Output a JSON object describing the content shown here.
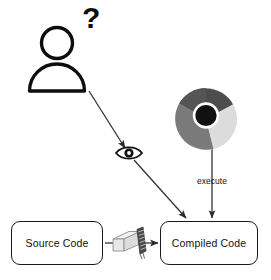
{
  "diagram": {
    "background_color": "#ffffff",
    "line_color": "#333333",
    "stroke_color": "#1a1a1a",
    "nodes": [
      {
        "id": "source_code",
        "label": "Source Code",
        "shape": "rounded-rectangle"
      },
      {
        "id": "compiled_code",
        "label": "Compiled Code",
        "shape": "rounded-rectangle"
      }
    ],
    "icons": [
      {
        "id": "person",
        "name": "person-icon",
        "description": "user silhouette with head and shoulders"
      },
      {
        "id": "question",
        "name": "question-mark",
        "label": "?"
      },
      {
        "id": "eye",
        "name": "eye-icon",
        "description": "eye observing"
      },
      {
        "id": "chrome",
        "name": "chrome-browser-icon",
        "description": "browser logo circle with center dot"
      },
      {
        "id": "compiler",
        "name": "compiler-icon",
        "description": "compiler machine grinding documents"
      }
    ],
    "edges": [
      {
        "id": "source_to_compiler",
        "label": "",
        "from": "source_code",
        "to": "compiler"
      },
      {
        "id": "compiler_to_compiled",
        "label": "",
        "from": "compiler",
        "to": "compiled_code"
      },
      {
        "id": "person_to_compiled",
        "label": "",
        "from": "person",
        "to": "compiled_code",
        "via": "eye"
      },
      {
        "id": "chrome_to_compiled",
        "label": "execute",
        "from": "chrome",
        "to": "compiled_code"
      }
    ],
    "labels": {
      "execute": "execute",
      "question": "?"
    },
    "colors": {
      "chrome_dark_wedge": "#4d4d4d",
      "chrome_light_wedge": "#d9d9d9",
      "chrome_mid_wedge": "#8c8c8c",
      "chrome_center": "#111111",
      "stroke": "#1a1a1a",
      "line": "#333333"
    }
  }
}
